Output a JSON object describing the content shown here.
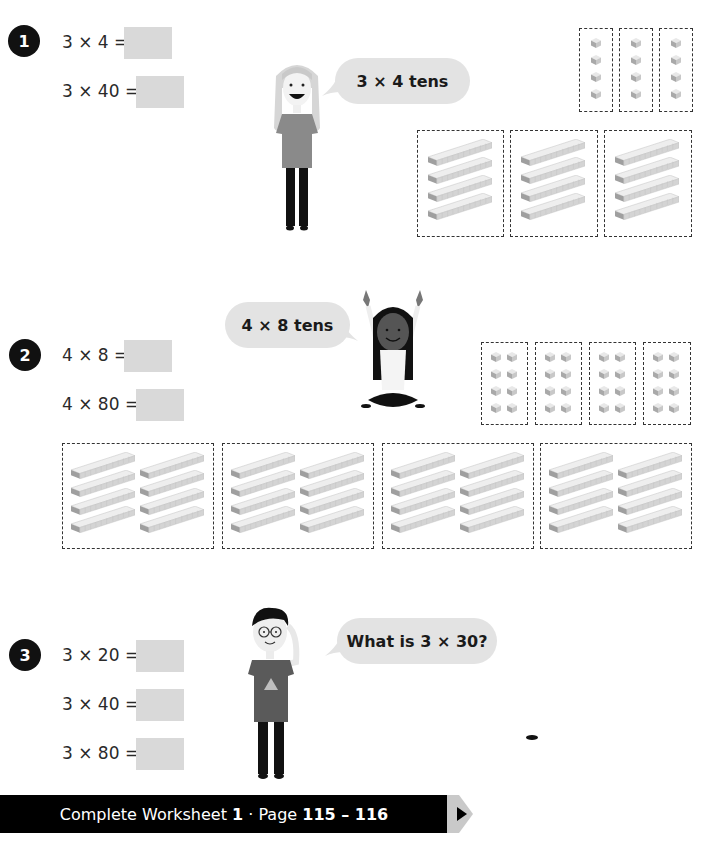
{
  "questions": [
    {
      "number": "1",
      "equations": [
        {
          "label": "3 × 4 =",
          "answer": ""
        },
        {
          "label": "3 × 40 =",
          "answer": ""
        }
      ],
      "speech_bubble": "3 × 4 tens",
      "character": "girl-standing",
      "ones_groups": 3,
      "ones_per_group": 4,
      "tens_groups": 3,
      "tens_per_group": 4
    },
    {
      "number": "2",
      "equations": [
        {
          "label": "4 × 8 =",
          "answer": ""
        },
        {
          "label": "4 × 80 =",
          "answer": ""
        }
      ],
      "speech_bubble": "4 × 8 tens",
      "character": "girl-sitting-arms-up",
      "ones_groups": 4,
      "ones_per_group": 8,
      "tens_groups": 4,
      "tens_per_group": 8
    },
    {
      "number": "3",
      "equations": [
        {
          "label": "3 × 20 =",
          "answer": ""
        },
        {
          "label": "3 × 40 =",
          "answer": ""
        },
        {
          "label": "3 × 80 =",
          "answer": ""
        }
      ],
      "speech_bubble": "What is 3 × 30?",
      "character": "boy-with-glasses"
    }
  ],
  "footer": {
    "prefix": "Complete Worksheet ",
    "worksheet": "1",
    "separator": " · Page ",
    "pages": "115 – 116"
  },
  "colors": {
    "answer_box": "#d9d9d9",
    "bubble": "#e3e3e3",
    "footer_bg": "#000000",
    "dash_border": "#333333"
  }
}
